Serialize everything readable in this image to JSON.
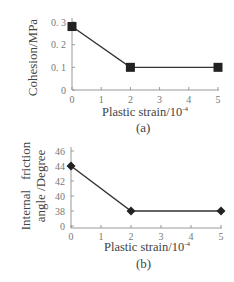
{
  "chart_data": [
    {
      "type": "line",
      "title": "",
      "caption": "(a)",
      "xlabel": "Plastic strain/10",
      "xlabel_exp": "-4",
      "ylabel": "Cohesion/MPa",
      "x": [
        0,
        2,
        5
      ],
      "values": [
        0.28,
        0.1,
        0.1
      ],
      "marker": "square",
      "xticks": [
        "0",
        "1",
        "2",
        "3",
        "4",
        "5"
      ],
      "yticks": [
        "0",
        "0. 1",
        "0. 2",
        "0. 3"
      ],
      "xlim": [
        0,
        5
      ],
      "ylim": [
        0,
        0.3
      ],
      "grid": false,
      "legend": null
    },
    {
      "type": "line",
      "title": "",
      "caption": "(b)",
      "xlabel": "Plastic strain/10",
      "xlabel_exp": "-4",
      "ylabel_line1": "Internal   friction",
      "ylabel_line2": "angle /Degree",
      "x": [
        0,
        2,
        5
      ],
      "values": [
        44,
        38,
        38
      ],
      "marker": "diamond",
      "xticks": [
        "0",
        "1",
        "2",
        "3",
        "4",
        "5"
      ],
      "yticks": [
        "0",
        "38",
        "40",
        "42",
        "44",
        "46"
      ],
      "xlim": [
        0,
        5
      ],
      "ylim_break": "axis broken between 0 and 38",
      "grid": false,
      "legend": null
    }
  ],
  "colors": {
    "line": "#333333",
    "marker": "#222222",
    "axis": "#999999",
    "text": "#444444"
  }
}
